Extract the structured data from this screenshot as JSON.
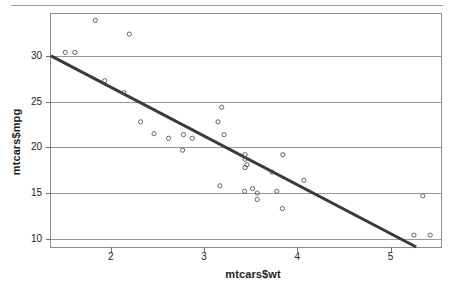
{
  "figure": {
    "y_axis_label": "mtcars$mpg",
    "x_axis_label": "mtcars$wt"
  },
  "chart_data": {
    "type": "scatter",
    "title": "",
    "xlabel": "mtcars$wt",
    "ylabel": "mtcars$mpg",
    "xlim": [
      1.36,
      5.54
    ],
    "ylim": [
      9.1,
      34.6
    ],
    "xticks": [
      2,
      3,
      4,
      5
    ],
    "yticks": [
      10,
      15,
      20,
      25,
      30
    ],
    "grid": true,
    "grid_axis": "y",
    "grid_color": "#999999",
    "point_color": "#555555",
    "point_marker": "open-circle",
    "legend": "none",
    "x": [
      2.62,
      2.875,
      2.32,
      3.215,
      3.44,
      3.46,
      3.57,
      3.19,
      3.15,
      3.44,
      3.44,
      4.07,
      3.73,
      3.78,
      5.25,
      5.424,
      5.345,
      2.2,
      1.615,
      1.835,
      2.465,
      3.52,
      3.435,
      3.84,
      3.845,
      1.935,
      2.14,
      1.513,
      3.17,
      2.77,
      3.57,
      2.78
    ],
    "y": [
      21.0,
      21.0,
      22.8,
      21.4,
      18.7,
      18.1,
      14.3,
      24.4,
      22.8,
      19.2,
      17.8,
      16.4,
      17.3,
      15.2,
      10.4,
      10.4,
      14.7,
      32.4,
      30.4,
      33.9,
      21.5,
      15.5,
      15.2,
      13.3,
      19.2,
      27.3,
      26.0,
      30.4,
      15.8,
      19.7,
      15.0,
      21.4
    ],
    "series": [
      {
        "name": "mtcars observations",
        "x": [
          2.62,
          2.875,
          2.32,
          3.215,
          3.44,
          3.46,
          3.57,
          3.19,
          3.15,
          3.44,
          3.44,
          4.07,
          3.73,
          3.78,
          5.25,
          5.424,
          5.345,
          2.2,
          1.615,
          1.835,
          2.465,
          3.52,
          3.435,
          3.84,
          3.845,
          1.935,
          2.14,
          1.513,
          3.17,
          2.77,
          3.57,
          2.78
        ],
        "y": [
          21.0,
          21.0,
          22.8,
          21.4,
          18.7,
          18.1,
          14.3,
          24.4,
          22.8,
          19.2,
          17.8,
          16.4,
          17.3,
          15.2,
          10.4,
          10.4,
          14.7,
          32.4,
          30.4,
          33.9,
          21.5,
          15.5,
          15.2,
          13.3,
          19.2,
          27.3,
          26.0,
          30.4,
          15.8,
          19.7,
          15.0,
          21.4
        ]
      }
    ],
    "fit_line": {
      "type": "linear-regression",
      "intercept": 37.285,
      "slope": -5.344,
      "color": "#3a3a3a",
      "width": 3
    }
  }
}
